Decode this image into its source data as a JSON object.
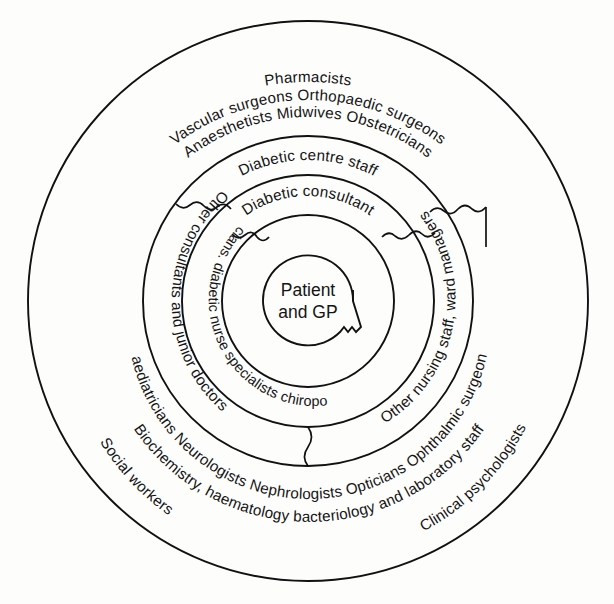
{
  "diagram": {
    "type": "concentric-rings",
    "center": {
      "x": 308,
      "y": 301
    },
    "stroke_color": "#111111",
    "background_color": "#fdfdfc",
    "text_color": "#141414",
    "core": {
      "label_line1": "Patient",
      "label_line2": "and GP",
      "radius": 45
    },
    "rings": [
      {
        "index": 1,
        "name": "ring-inner",
        "inner_radius": 45,
        "outer_radius": 86,
        "labels": [
          {
            "text": "Diabetic consultant",
            "position": "top"
          },
          {
            "text": "Dieticians. diabetic nurse specialists chiropodists",
            "position": "bottom"
          }
        ]
      },
      {
        "index": 2,
        "name": "ring-second",
        "inner_radius": 86,
        "outer_radius": 126,
        "labels": [
          {
            "text": "Diabetic centre staff",
            "position": "top"
          },
          {
            "text": "Other nursing staff, ward managers",
            "position": "bottom-right"
          }
        ]
      },
      {
        "index": 3,
        "name": "ring-third",
        "inner_radius": 126,
        "outer_radius": 165,
        "labels": [
          {
            "text": "Other consultants and junior doctors",
            "position": "left"
          },
          {
            "text": "Other nursing staff, ward managers",
            "position": "right"
          }
        ]
      },
      {
        "index": 4,
        "name": "ring-outer",
        "inner_radius": 165,
        "outer_radius": 280,
        "labels": [
          {
            "text": "Pharmacists",
            "position": "top"
          },
          {
            "text": "Vascular surgeons  Orthopaedic surgeons",
            "position": "top-arc-2"
          },
          {
            "text": "Anaesthetists  Midwives  Obstetricians",
            "position": "top-arc-3"
          },
          {
            "text": "Paediatricians  Neurologists  Nephrologists  Opticians  Ophthalmic surgeons",
            "position": "bottom-arc-1"
          },
          {
            "text": "Biochemistry, haematology bacteriology and laboratory staff",
            "position": "bottom-arc-2"
          },
          {
            "text": "Social workers",
            "position": "bottom-arc-3-left"
          },
          {
            "text": "Clinical psychologists",
            "position": "bottom-arc-3-right"
          }
        ]
      }
    ],
    "arc_labels": {
      "pharmacists": "Pharmacists",
      "vascular_orthopaedic": "Vascular surgeons  Orthopaedic surgeons",
      "anaesthetists_midwives_obstetricians": "Anaesthetists  Midwives  Obstetricians",
      "diabetic_centre_staff": "Diabetic centre staff",
      "diabetic_consultant": "Diabetic consultant",
      "other_consultants_junior_doctors": "Other consultants and junior doctors",
      "dieticians_nurses_chiropodists": "Dieticians. diabetic nurse specialists chiropodists",
      "other_nursing_ward_managers": "Other nursing staff, ward managers",
      "other_nursing_lower": "Other nursing staff, ward managers",
      "paediatricians_row": "Paediatricians  Neurologists  Nephrologists  Opticians  Ophthalmic surgeons",
      "biochemistry_row": "Biochemistry, haematology bacteriology and laboratory staff",
      "social_workers": "Social workers",
      "clinical_psychologists": "Clinical psychologists"
    }
  }
}
